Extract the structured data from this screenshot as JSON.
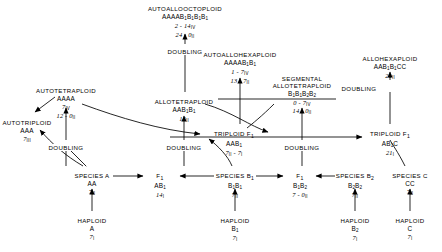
{
  "diagram": {
    "doubling_label": "DOUBLING",
    "nodes": [
      {
        "id": "autoallooctoploid",
        "name": "AUTOALLOOCTOPLOID",
        "genome": "AAAAB<sub>1</sub>B<sub>1</sub>B<sub>1</sub>B<sub>1</sub>",
        "config": [
          "2 - 14<span class=\"rom\">IV</span>",
          "24 - 0<span class=\"rom\">II</span>"
        ],
        "x": 185,
        "y": 6
      },
      {
        "id": "autoallohexaploid",
        "name": "AUTOALLOHEXAPLOID",
        "genome": "AAAAB<sub>1</sub>B<sub>1</sub>",
        "config": [
          "1 - 7<span class=\"rom\">IV</span>",
          "13 - 7<span class=\"rom\">II</span>"
        ],
        "x": 240,
        "y": 52
      },
      {
        "id": "allohexaploid",
        "name": "ALLOHEXAPLOID",
        "genome": "AAB<sub>1</sub>B<sub>1</sub>CC",
        "config": [
          "21<span class=\"rom\">II</span>"
        ],
        "x": 390,
        "y": 56
      },
      {
        "id": "segmental-allotetraploid",
        "name": "SEGMENTAL<br>ALLOTETRAPLOID",
        "genome": "B<sub>1</sub>B<sub>1</sub>B<sub>2</sub>B<sub>2</sub>",
        "config": [
          "0 - 7<span class=\"rom\">IV</span>",
          "14 - 0<span class=\"rom\">II</span>"
        ],
        "x": 302,
        "y": 76
      },
      {
        "id": "autotetraploid",
        "name": "AUTOTETRAPLOID",
        "genome": "AAAA",
        "config": [
          "7<span class=\"rom\">IV</span>",
          "12 - 0<span class=\"rom\">II</span>"
        ],
        "x": 66,
        "y": 88
      },
      {
        "id": "allotetraploid",
        "name": "ALLOTETRAPLOID",
        "genome": "AAB<sub>1</sub>B<sub>1</sub>",
        "config": [
          "14<span class=\"rom\">II</span>"
        ],
        "x": 184,
        "y": 99
      },
      {
        "id": "autotriploid",
        "name": "AUTOTRIPLOID",
        "genome": "AAA",
        "config": [
          "7<span class=\"rom\">III</span>"
        ],
        "x": 27,
        "y": 120
      },
      {
        "id": "triploid-f1-left",
        "name": "TRIPLOID F<sub>1</sub>",
        "genome": "AAB<sub>1</sub>",
        "config": [
          "7<span class=\"rom\">II</span> - 7<span class=\"rom\">I</span>"
        ],
        "x": 234,
        "y": 131
      },
      {
        "id": "triploid-f1-right",
        "name": "TRIPLOID F<sub>1</sub>",
        "genome": "AB<sub>1</sub>C",
        "config": [
          "21<span class=\"rom\">I</span>"
        ],
        "x": 390,
        "y": 131
      },
      {
        "id": "species-a",
        "name": "SPECIES A",
        "genome": "AA",
        "config": [
          "7<span class=\"rom\">II</span>"
        ],
        "x": 92,
        "y": 173
      },
      {
        "id": "f1-ab1",
        "name": "F<sub>1</sub>",
        "genome": "AB<sub>1</sub>",
        "config": [
          "14<span class=\"rom\">I</span>"
        ],
        "x": 160,
        "y": 173
      },
      {
        "id": "species-b1",
        "name": "SPECIES B<sub>1</sub>",
        "genome": "B<sub>1</sub>B<sub>1</sub>",
        "config": [
          "7<span class=\"rom\">II</span>"
        ],
        "x": 235,
        "y": 173
      },
      {
        "id": "f1-b1b2",
        "name": "F<sub>1</sub>",
        "genome": "B<sub>1</sub>B<sub>2</sub>",
        "config": [
          "7 - 0<span class=\"rom\">II</span>"
        ],
        "x": 300,
        "y": 173
      },
      {
        "id": "species-b2",
        "name": "SPECIES B<sub>2</sub>",
        "genome": "B<sub>2</sub>B<sub>2</sub>",
        "config": [
          "7<span class=\"rom\">II</span>"
        ],
        "x": 355,
        "y": 173
      },
      {
        "id": "species-c",
        "name": "SPECIES C",
        "genome": "CC",
        "config": [
          "7<span class=\"rom\">II</span>"
        ],
        "x": 410,
        "y": 173
      },
      {
        "id": "haploid-a",
        "name": "HAPLOID",
        "genome": "A",
        "config": [
          "7<span class=\"rom\">I</span>"
        ],
        "x": 92,
        "y": 218
      },
      {
        "id": "haploid-b1",
        "name": "HAPLOID",
        "genome": "B<sub>1</sub>",
        "config": [
          "7<span class=\"rom\">I</span>"
        ],
        "x": 235,
        "y": 218
      },
      {
        "id": "haploid-b2",
        "name": "HAPLOID",
        "genome": "B<sub>2</sub>",
        "config": [
          "7<span class=\"rom\">I</span>"
        ],
        "x": 355,
        "y": 218
      },
      {
        "id": "haploid-c",
        "name": "HAPLOID",
        "genome": "C",
        "config": [
          "7<span class=\"rom\">I</span>"
        ],
        "x": 410,
        "y": 218
      }
    ],
    "doubling_labels": [
      {
        "id": "doubling-octoploid",
        "x": 185,
        "y": 48
      },
      {
        "id": "doubling-hexaploid",
        "x": 359,
        "y": 85
      },
      {
        "id": "doubling-autotetraploid",
        "x": 66,
        "y": 144
      },
      {
        "id": "doubling-allotetraploid",
        "x": 184,
        "y": 144
      },
      {
        "id": "doubling-segmental",
        "x": 302,
        "y": 144
      }
    ]
  }
}
